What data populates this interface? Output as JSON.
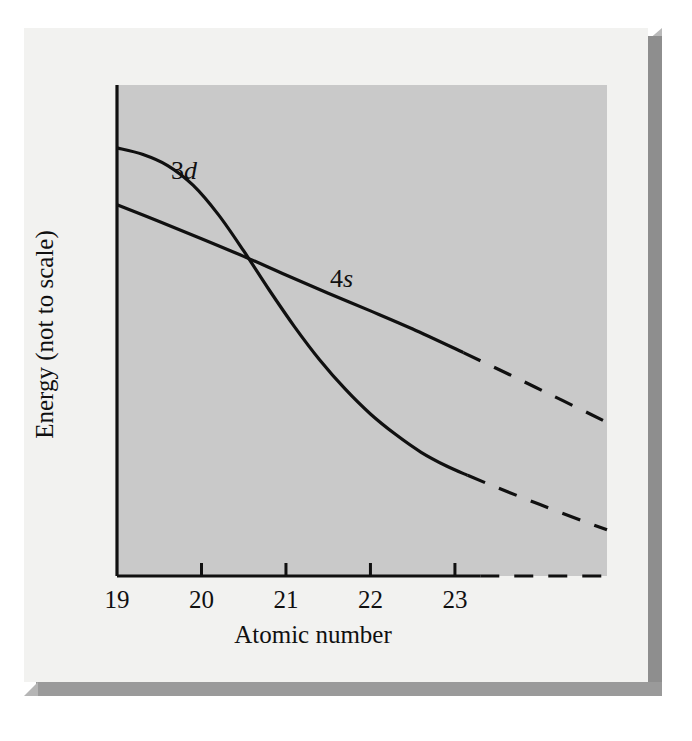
{
  "figure": {
    "caption_present": false,
    "panel_bg": "#c9c9c9",
    "card_bg": "#f2f2f0",
    "ink": "#101010"
  },
  "axes": {
    "x_title": "Atomic number",
    "y_title": "Energy (not  to scale)",
    "x_ticks": [
      "19",
      "20",
      "21",
      "22",
      "23"
    ]
  },
  "series_labels": {
    "three_d": {
      "number": "3",
      "orbital": "d"
    },
    "four_s": {
      "number": "4",
      "orbital": "s"
    }
  },
  "chart_data": {
    "type": "line",
    "title": "",
    "subtitle": "",
    "xlabel": "Atomic number",
    "ylabel": "Energy (not  to scale)",
    "xlim": [
      19,
      24.8
    ],
    "ylim": [
      0,
      1
    ],
    "grid": false,
    "legend": "inline-curve-labels",
    "x_tick_values": [
      19,
      20,
      21,
      22,
      23
    ],
    "x_tick_labels": [
      "19",
      "20",
      "21",
      "22",
      "23"
    ],
    "y_tick_values": [],
    "y_tick_labels": [],
    "note": "Energy axis is qualitative (not to scale); no numeric y ticks are drawn. Both curves fall with increasing atomic number and cross near Z = 20.6, where 3d drops below 4s.",
    "annotations": [
      {
        "text": "3d",
        "x": 20.65,
        "y": 0.845,
        "style": "italic-d"
      },
      {
        "text": "4s",
        "x": 21.55,
        "y": 0.625,
        "style": "italic-s"
      }
    ],
    "crossing_point": {
      "x": 20.68,
      "y": 0.627
    },
    "series": [
      {
        "name": "3d",
        "style": "solid-then-dashed",
        "solid_range": [
          19,
          23.15
        ],
        "dashed_range": [
          23.15,
          24.8
        ],
        "x": [
          19.0,
          19.3,
          19.6,
          19.9,
          20.2,
          20.5,
          20.8,
          21.1,
          21.4,
          21.7,
          22.0,
          22.3,
          22.6,
          22.9,
          23.15,
          23.5,
          24.0,
          24.5,
          24.8
        ],
        "y": [
          0.872,
          0.859,
          0.836,
          0.796,
          0.736,
          0.662,
          0.583,
          0.508,
          0.44,
          0.381,
          0.33,
          0.288,
          0.252,
          0.224,
          0.205,
          0.18,
          0.146,
          0.113,
          0.094
        ]
      },
      {
        "name": "4s",
        "style": "solid-then-dashed",
        "solid_range": [
          19,
          23.1
        ],
        "dashed_range": [
          23.1,
          24.8
        ],
        "x": [
          19.0,
          19.5,
          20.0,
          20.5,
          21.0,
          21.5,
          22.0,
          22.5,
          23.1,
          23.6,
          24.1,
          24.6,
          24.8
        ],
        "y": [
          0.756,
          0.722,
          0.687,
          0.651,
          0.613,
          0.576,
          0.54,
          0.503,
          0.455,
          0.414,
          0.372,
          0.33,
          0.313
        ]
      },
      {
        "name": "x-axis-baseline",
        "style": "solid-then-dashed",
        "solid_range": [
          19,
          23.3
        ],
        "dashed_range": [
          23.3,
          24.8
        ],
        "is_axis": true
      }
    ]
  }
}
